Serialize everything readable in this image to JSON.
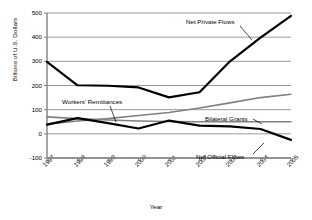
{
  "chart_data": {
    "type": "line",
    "title": "",
    "xlabel": "Year",
    "ylabel": "Billions of U.S. Dollars",
    "categories": [
      "1997",
      "1998",
      "1999",
      "2000",
      "2001",
      "2002",
      "2003",
      "2004",
      "2005"
    ],
    "ylim": [
      -100,
      500
    ],
    "yticks": [
      -100,
      0,
      100,
      200,
      300,
      400,
      500
    ],
    "grid": true,
    "legend": "annotations-inline",
    "series": [
      {
        "name": "Net Private Flows",
        "color": "#000000",
        "width": 2.2,
        "values": [
          298,
          201,
          199,
          192,
          151,
          172,
          300,
          398,
          488
        ]
      },
      {
        "name": "Workers' Remittances",
        "color": "#808080",
        "width": 1.6,
        "values": [
          40,
          53,
          63,
          76,
          88,
          107,
          128,
          150,
          164
        ]
      },
      {
        "name": "Bilateral Grants",
        "color": "#808080",
        "width": 1.6,
        "values": [
          70,
          63,
          57,
          53,
          51,
          50,
          50,
          50,
          50
        ]
      },
      {
        "name": "Net Official Flows",
        "color": "#000000",
        "width": 2.2,
        "values": [
          38,
          65,
          44,
          22,
          55,
          34,
          31,
          20,
          -25
        ]
      }
    ],
    "annotations": [
      {
        "id": "net-private",
        "text": "Net Private Flows"
      },
      {
        "id": "remittances",
        "text": "Workers' Remittances"
      },
      {
        "id": "bilateral",
        "text": "Bilateral Grants"
      },
      {
        "id": "official",
        "text": "Net Official Flows"
      }
    ]
  },
  "colors": {
    "axis": "#808080",
    "grid": "#808080",
    "dark_series": "#000000",
    "gray_series": "#808080",
    "background": "#ffffff"
  }
}
